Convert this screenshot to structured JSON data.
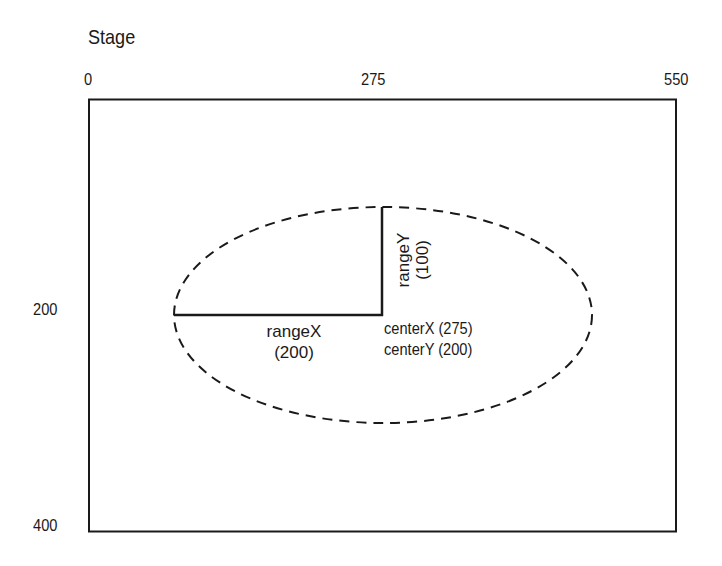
{
  "title": "Stage",
  "axis": {
    "x_ticks": [
      "0",
      "275",
      "550"
    ],
    "y_ticks": [
      "200",
      "400"
    ]
  },
  "ellipse": {
    "style": "dashed",
    "rangeX_label": "rangeX",
    "rangeX_value": "(200)",
    "rangeY_label": "rangeY",
    "rangeY_value": "(100)",
    "centerX_label": "centerX (275)",
    "centerY_label": "centerY (200)"
  },
  "colors": {
    "stroke": "#1a1a1a",
    "background": "#ffffff"
  }
}
